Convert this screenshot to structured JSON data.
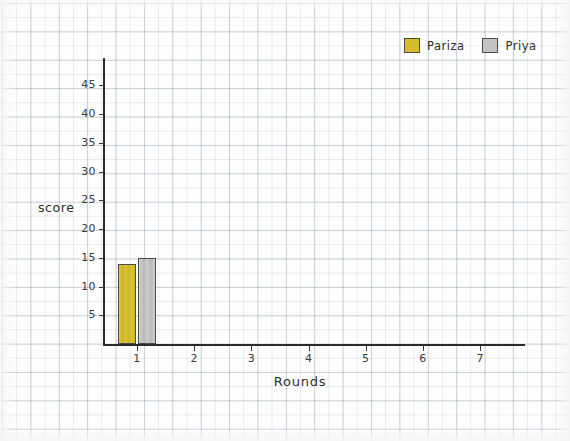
{
  "chart_data": {
    "type": "bar",
    "title": "",
    "xlabel": "Rounds",
    "ylabel": "score",
    "categories": [
      "1",
      "2",
      "3",
      "4",
      "5",
      "6",
      "7"
    ],
    "series": [
      {
        "name": "Pariza",
        "color": "#d6bd2c",
        "values": [
          14,
          0,
          0,
          0,
          0,
          0,
          0
        ]
      },
      {
        "name": "Priya",
        "color": "#c2c2c2",
        "values": [
          15,
          0,
          0,
          0,
          0,
          0,
          0
        ]
      }
    ],
    "ylim": [
      0,
      47
    ],
    "xlim": [
      0.4,
      7.6
    ],
    "yticks": [
      "5",
      "10",
      "15",
      "20",
      "25",
      "30",
      "35",
      "40",
      "45"
    ],
    "ytick_values": [
      5,
      10,
      15,
      20,
      25,
      30,
      35,
      40,
      45
    ],
    "xticks": [
      "1",
      "2",
      "3",
      "4",
      "5",
      "6",
      "7"
    ],
    "grid": true,
    "grid_style": "graph-paper",
    "legend_position": "top-right",
    "background": "#fdfdfd",
    "axis_color": "#2b2b2b"
  },
  "legend": {
    "items": [
      {
        "label": "Pariza",
        "swatch": "yellow-swatch"
      },
      {
        "label": "Priya",
        "swatch": "gray-swatch"
      }
    ]
  },
  "axes": {
    "y_title": "score",
    "x_title": "Rounds"
  }
}
